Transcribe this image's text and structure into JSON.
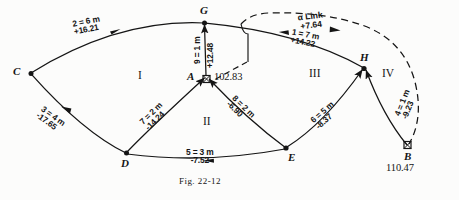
{
  "figure": {
    "caption_prefix": "Fig.",
    "caption_number": "22-12",
    "caption_full": "FIG. 22-12"
  },
  "nodes": [
    {
      "id": "C",
      "label": "C",
      "value": "",
      "marker": "dot"
    },
    {
      "id": "G",
      "label": "G",
      "value": "",
      "marker": "dot"
    },
    {
      "id": "A",
      "label": "A",
      "value": "102.83",
      "marker": "square"
    },
    {
      "id": "H",
      "label": "H",
      "value": "",
      "marker": "dot"
    },
    {
      "id": "B",
      "label": "B",
      "value": "110.47",
      "marker": "square"
    },
    {
      "id": "D",
      "label": "D",
      "value": "",
      "marker": "dot"
    },
    {
      "id": "E",
      "label": "E",
      "value": "",
      "marker": "dot"
    }
  ],
  "regions": [
    {
      "id": "I",
      "label": "I"
    },
    {
      "id": "II",
      "label": "II"
    },
    {
      "id": "III",
      "label": "III"
    },
    {
      "id": "IV",
      "label": "IV"
    }
  ],
  "edges": [
    {
      "id": "2",
      "from": "C",
      "to": "G",
      "length": "2 = 6 m",
      "correction": "+16.21"
    },
    {
      "id": "9",
      "from": "A",
      "to": "G",
      "length": "9 = 1 m",
      "correction": "+12.48"
    },
    {
      "id": "1",
      "from": "H",
      "to": "G",
      "length": "1 = 7 m",
      "correction": "+14.22"
    },
    {
      "id": "3",
      "from": "D",
      "to": "C",
      "length": "3 = 4 m",
      "correction": "-17.65"
    },
    {
      "id": "7",
      "from": "D",
      "to": "A",
      "length": "7 = 2 m",
      "correction": "-14.24"
    },
    {
      "id": "8",
      "from": "E",
      "to": "A",
      "length": "8 = 2 m",
      "correction": "-6.90"
    },
    {
      "id": "5",
      "from": "D",
      "to": "E",
      "length": "5 = 3 m",
      "correction": "-7.52"
    },
    {
      "id": "6",
      "from": "E",
      "to": "H",
      "length": "6 = 5 m",
      "correction": "-8.37"
    },
    {
      "id": "4",
      "from": "B",
      "to": "H",
      "length": "4 = 1 m",
      "correction": "-9.23"
    }
  ],
  "link": {
    "label": "α Link",
    "correction": "+7.64"
  },
  "colors": {
    "ink": "#151515",
    "paper": "#fcfcfb"
  }
}
